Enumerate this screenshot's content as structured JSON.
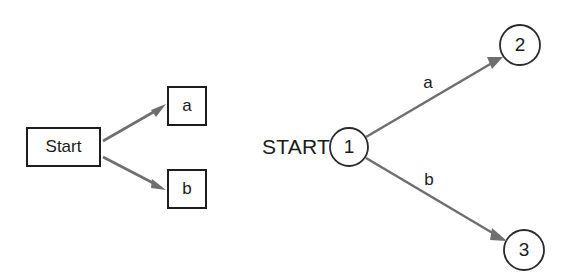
{
  "figure": {
    "background_color": "#ffffff",
    "stroke_color": "#1d1d1d",
    "edge_color": "#6f6f6f",
    "text_color": "#1a1a1a"
  },
  "left_diagram": {
    "name": "box-notation-diagram",
    "start_box": {
      "label": "Start",
      "x": 27,
      "y": 128,
      "width": 73,
      "height": 38
    },
    "target_boxes": [
      {
        "label": "a",
        "x": 168,
        "y": 87,
        "width": 38,
        "height": 38
      },
      {
        "label": "b",
        "x": 168,
        "y": 170,
        "width": 38,
        "height": 38
      }
    ],
    "edges": [
      {
        "from": "Start",
        "to": "a",
        "x1": 103,
        "y1": 140,
        "x2": 164,
        "y2": 107
      },
      {
        "from": "Start",
        "to": "b",
        "x1": 103,
        "y1": 157,
        "x2": 164,
        "y2": 189
      }
    ]
  },
  "right_diagram": {
    "name": "state-notation-diagram",
    "start_label": "START",
    "start_label_x": 330,
    "start_label_y": 147,
    "nodes": [
      {
        "id": "1",
        "label": "1",
        "cx": 349,
        "cy": 147,
        "r": 19
      },
      {
        "id": "2",
        "label": "2",
        "cx": 520,
        "cy": 45,
        "r": 20
      },
      {
        "id": "3",
        "label": "3",
        "cx": 524,
        "cy": 250,
        "r": 20
      }
    ],
    "edges": [
      {
        "from": "1",
        "to": "2",
        "label": "a",
        "x1": 366,
        "y1": 137,
        "x2": 502,
        "y2": 58,
        "label_x": 428,
        "label_y": 84
      },
      {
        "from": "1",
        "to": "3",
        "label": "b",
        "x1": 366,
        "y1": 158,
        "x2": 505,
        "y2": 240,
        "label_x": 429,
        "label_y": 181
      }
    ]
  }
}
